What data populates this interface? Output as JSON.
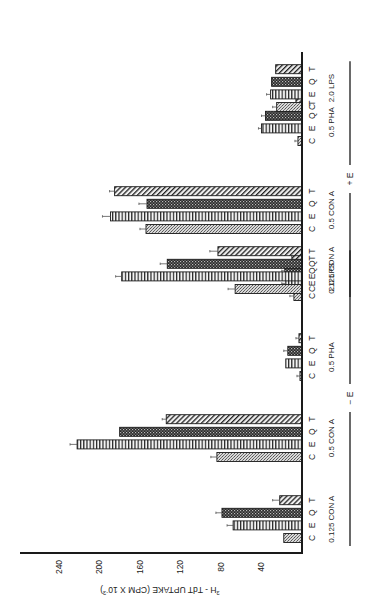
{
  "chart_data": {
    "type": "bar",
    "orientation": "rotated-90-ccw (value axis along bottom, bars extend leftward from baseline on right)",
    "title": "",
    "ylabel": "³H-TdT UPTAKE (CPM X 10⁻³)",
    "ylabel_parts": {
      "sup": "3",
      "main": "H - TdT  UPTAKE (CPM X 10",
      "exp": "-3",
      "close": ")"
    },
    "xlabel": "",
    "ylim": [
      0,
      260
    ],
    "yticks": [
      40,
      80,
      120,
      160,
      200,
      240
    ],
    "grid": false,
    "legend": "none (series identified by letters C, E, Q, T under each bar)",
    "series_letters": [
      "C",
      "E",
      "Q",
      "T"
    ],
    "series_patterns": {
      "C": "light-stipple",
      "E": "vertical-stripes",
      "Q": "dark-checker",
      "T": "diagonal-hatch"
    },
    "condition_groups": [
      {
        "label": "− E",
        "groups": [
          0,
          1,
          2,
          3
        ]
      },
      {
        "label": "+ E",
        "groups": [
          4,
          5,
          6,
          7
        ]
      }
    ],
    "categories": [
      "0.125 CON A (−E)",
      "0.5 CON A (−E)",
      "0.5 PHA (−E)",
      "2.0 LPS (−E)",
      "0.125 CON A (+E)",
      "0.5 CON A (+E)",
      "0.5 PHA (+E)",
      "2.0 LPS (+E)"
    ],
    "groups": [
      {
        "label": "0.125 CON A",
        "condition": "-E",
        "values": {
          "C": 18,
          "E": 68,
          "Q": 79,
          "T": 22
        },
        "errors": {
          "C": 0,
          "E": 4,
          "Q": 4,
          "T": 5
        }
      },
      {
        "label": "0.5 CON A",
        "condition": "-E",
        "values": {
          "C": 84,
          "E": 222,
          "Q": 180,
          "T": 134
        },
        "errors": {
          "C": 4,
          "E": 5,
          "Q": 0,
          "T": 2
        }
      },
      {
        "label": "0.5 PHA",
        "condition": "-E",
        "values": {
          "C": 2,
          "E": 16,
          "Q": 14,
          "T": 3
        },
        "errors": {
          "C": 1,
          "E": 0,
          "Q": 2,
          "T": 1
        }
      },
      {
        "label": "2.0 LPS",
        "condition": "-E",
        "values": {
          "C": 8,
          "E": 16,
          "Q": 17,
          "T": 10
        },
        "errors": {
          "C": 2,
          "E": 2,
          "Q": 1,
          "T": 0
        }
      },
      {
        "label": "0.125 CON A",
        "condition": "+E",
        "values": {
          "C": 66,
          "E": 178,
          "Q": 133,
          "T": 83
        },
        "errors": {
          "C": 5,
          "E": 4,
          "Q": 5,
          "T": 6
        }
      },
      {
        "label": "0.5 CON A",
        "condition": "+E",
        "values": {
          "C": 154,
          "E": 189,
          "Q": 153,
          "T": 185
        },
        "errors": {
          "C": 4,
          "E": 6,
          "Q": 6,
          "T": 3
        }
      },
      {
        "label": "0.5 PHA",
        "condition": "+E",
        "values": {
          "C": 4,
          "E": 40,
          "Q": 36,
          "T": 6
        },
        "errors": {
          "C": 1,
          "E": 1,
          "Q": 2,
          "T": 2
        }
      },
      {
        "label": "2.0 LPS",
        "condition": "+E",
        "values": {
          "C": 25,
          "E": 31,
          "Q": 30,
          "T": 26
        },
        "errors": {
          "C": 2,
          "E": 2,
          "Q": 0,
          "T": 0
        }
      }
    ],
    "series": [
      {
        "name": "C",
        "values": [
          18,
          84,
          2,
          8,
          66,
          154,
          4,
          25
        ]
      },
      {
        "name": "E",
        "values": [
          68,
          222,
          16,
          16,
          178,
          189,
          40,
          31
        ]
      },
      {
        "name": "Q",
        "values": [
          79,
          180,
          14,
          17,
          133,
          153,
          36,
          30
        ]
      },
      {
        "name": "T",
        "values": [
          22,
          134,
          3,
          10,
          83,
          185,
          6,
          26
        ]
      }
    ]
  },
  "layout": {
    "baseline_x": 302,
    "px_per_unit": 1.013,
    "axis_y": 553,
    "axis_left_x": 20,
    "baseline_top_y": 52,
    "bar_thickness": 9,
    "group_bottom_y": [
      538,
      457,
      376,
      296,
      289,
      229,
      141,
      107
    ],
    "bar_pitch": 12.6
  },
  "colors": {
    "ink": "#1a1a1a",
    "background": "#ffffff"
  }
}
